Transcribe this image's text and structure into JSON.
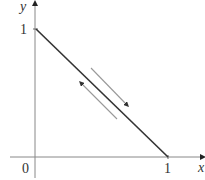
{
  "diagram": {
    "axes": {
      "x_label": "x",
      "y_label": "y",
      "origin_label": "0"
    },
    "ticks": {
      "x_tick_label": "1",
      "y_tick_label": "1"
    },
    "segment": {
      "from": [
        0,
        1
      ],
      "to": [
        1,
        0
      ]
    },
    "direction_arrows": [
      {
        "name": "arrow-toward-x-intercept",
        "direction": "down-right"
      },
      {
        "name": "arrow-toward-y-intercept",
        "direction": "up-left"
      }
    ],
    "colors": {
      "axis": "#888888",
      "segment": "#333333",
      "arrow": "#999999",
      "text": "#333333"
    }
  }
}
